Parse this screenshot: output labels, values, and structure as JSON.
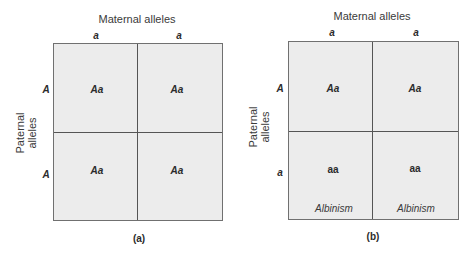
{
  "panels": [
    {
      "caption": "(a)",
      "maternal_label": "Maternal alleles",
      "paternal_label_line1": "Paternal",
      "paternal_label_line2": "alleles",
      "maternal_alleles": [
        "a",
        "a"
      ],
      "paternal_alleles": [
        "A",
        "A"
      ],
      "cells": [
        {
          "genotype": "Aa",
          "phenotype": ""
        },
        {
          "genotype": "Aa",
          "phenotype": ""
        },
        {
          "genotype": "Aa",
          "phenotype": ""
        },
        {
          "genotype": "Aa",
          "phenotype": ""
        }
      ]
    },
    {
      "caption": "(b)",
      "maternal_label": "Maternal alleles",
      "paternal_label_line1": "Paternal",
      "paternal_label_line2": "alleles",
      "maternal_alleles": [
        "a",
        "a"
      ],
      "paternal_alleles": [
        "A",
        "a"
      ],
      "cells": [
        {
          "genotype": "Aa",
          "phenotype": ""
        },
        {
          "genotype": "Aa",
          "phenotype": ""
        },
        {
          "genotype": "aa",
          "phenotype": "Albinism"
        },
        {
          "genotype": "aa",
          "phenotype": "Albinism"
        }
      ]
    }
  ],
  "colors": {
    "cell_fill": "#ececec",
    "border": "#707070",
    "divider": "#555555",
    "text": "#2b2b2b"
  }
}
